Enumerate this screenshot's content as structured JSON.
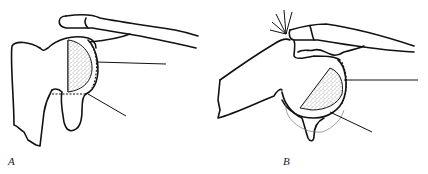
{
  "figure": {
    "panels": [
      {
        "id": "A",
        "label": "A"
      },
      {
        "id": "B",
        "label": "B"
      }
    ],
    "colors": {
      "ink": "#111111",
      "background": "#ffffff",
      "stipple": "#333333"
    }
  }
}
